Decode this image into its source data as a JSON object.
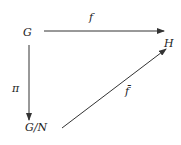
{
  "diagram": {
    "type": "commutative-diagram",
    "nodes": {
      "G": "G",
      "H": "H",
      "GN": "G/N"
    },
    "arrows": {
      "f": {
        "label": "f",
        "from": "G",
        "to": "H"
      },
      "pi": {
        "label": "π",
        "from": "G",
        "to": "G/N"
      },
      "fbar": {
        "label": "f̄",
        "from": "G/N",
        "to": "H"
      }
    },
    "colors": {
      "line": "#333333",
      "text": "#222222",
      "background": "#ffffff"
    }
  }
}
